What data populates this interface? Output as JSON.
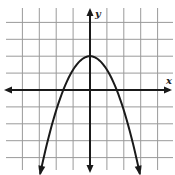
{
  "chart_data": {
    "type": "line",
    "title": "",
    "xlabel": "x",
    "ylabel": "y",
    "grid": true,
    "xlim": [
      -5,
      4
    ],
    "ylim": [
      -5,
      5
    ],
    "series": [
      {
        "name": "parabola",
        "equation": "y = -0.8x^2 + 2",
        "vertex": [
          0,
          2
        ],
        "x_intercepts": [
          -1.6,
          1.6
        ],
        "x": [
          -2.95,
          -2.5,
          -2,
          -1.5,
          -1,
          -0.5,
          0,
          0.5,
          1,
          1.5,
          2,
          2.5,
          2.95
        ],
        "values": [
          -4.96,
          -3.0,
          -1.2,
          0.2,
          1.2,
          1.8,
          2.0,
          1.8,
          1.2,
          0.2,
          -1.2,
          -3.0,
          -4.96
        ]
      }
    ]
  },
  "labels": {
    "x_axis": "x",
    "y_axis": "y"
  },
  "colors": {
    "grid": "#9a9a9a",
    "axis": "#1a1a1a",
    "curve": "#1a1a1a",
    "background": "#ffffff"
  }
}
